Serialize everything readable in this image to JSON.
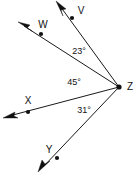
{
  "diagram": {
    "background_color": "#ffffff",
    "stroke_color": "#111111",
    "vertex": {
      "label": "Z",
      "x": 119,
      "y": 87,
      "label_x": 130,
      "label_y": 87
    },
    "rays": [
      {
        "name": "ray-zv",
        "label": "V",
        "from_x": 119,
        "from_y": 87,
        "to_x": 60,
        "to_y": 6,
        "tip_x": 56,
        "tip_y": 1,
        "dot_x": 72,
        "dot_y": 18,
        "label_x": 81,
        "label_y": 11
      },
      {
        "name": "ray-zw",
        "label": "W",
        "from_x": 119,
        "from_y": 87,
        "to_x": 24,
        "to_y": 26,
        "tip_x": 18,
        "tip_y": 22,
        "dot_x": 41,
        "dot_y": 34,
        "label_x": 43,
        "label_y": 25
      },
      {
        "name": "ray-zx",
        "label": "X",
        "from_x": 119,
        "from_y": 87,
        "to_x": 9,
        "to_y": 116,
        "tip_x": 3,
        "tip_y": 118,
        "dot_x": 28,
        "dot_y": 112,
        "label_x": 28,
        "label_y": 101
      },
      {
        "name": "ray-zy",
        "label": "Y",
        "from_x": 119,
        "from_y": 87,
        "to_x": 43,
        "to_y": 167,
        "tip_x": 38,
        "tip_y": 172,
        "dot_x": 57,
        "dot_y": 158,
        "label_x": 49,
        "label_y": 150
      }
    ],
    "angles": [
      {
        "name": "angle-vzw",
        "text": "23°",
        "value": 23,
        "between": [
          "V",
          "W"
        ],
        "x": 79,
        "y": 52
      },
      {
        "name": "angle-wzx",
        "text": "45°",
        "value": 45,
        "between": [
          "W",
          "X"
        ],
        "x": 74,
        "y": 83
      },
      {
        "name": "angle-xzy",
        "text": "31°",
        "value": 31,
        "between": [
          "X",
          "Y"
        ],
        "x": 84,
        "y": 111
      }
    ]
  }
}
